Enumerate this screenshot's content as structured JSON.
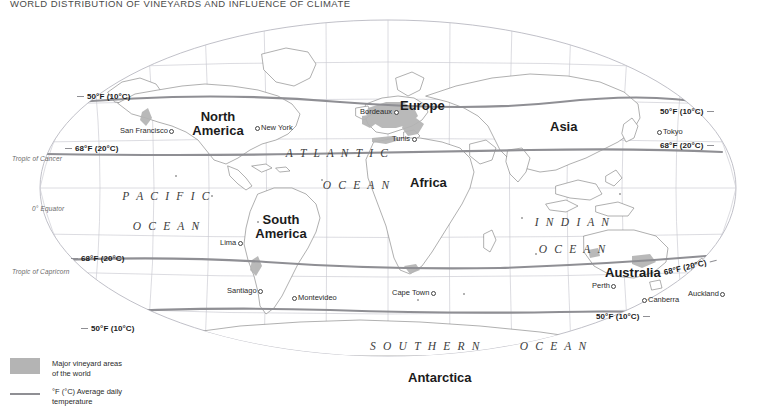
{
  "title": "WORLD DISTRIBUTION OF VINEYARDS AND INFLUENCE OF CLIMATE",
  "continents": [
    {
      "name": "north-america",
      "line1": "North",
      "line2": "America"
    },
    {
      "name": "south-america",
      "line1": "South",
      "line2": "America"
    },
    {
      "name": "europe",
      "line1": "Europe",
      "line2": ""
    },
    {
      "name": "africa",
      "line1": "Africa",
      "line2": ""
    },
    {
      "name": "asia",
      "line1": "Asia",
      "line2": ""
    },
    {
      "name": "australia",
      "line1": "Australia",
      "line2": ""
    },
    {
      "name": "antarctica",
      "line1": "Antarctica",
      "line2": ""
    }
  ],
  "oceans": [
    {
      "name": "pacific-ocean",
      "line1": "P A C I F I C",
      "line2": "O C E A N"
    },
    {
      "name": "atlantic-ocean",
      "line1": "A T L A N T I C",
      "line2": "O C E A N"
    },
    {
      "name": "indian-ocean",
      "line1": "I N D I A N",
      "line2": "O C E A N"
    },
    {
      "name": "southern-ocean",
      "line1": "S O U T H E R N",
      "line2": "O C E A N"
    }
  ],
  "cities": [
    {
      "name": "san-francisco",
      "label": "San Francisco"
    },
    {
      "name": "new-york",
      "label": "New York"
    },
    {
      "name": "bordeaux",
      "label": "Bordeaux"
    },
    {
      "name": "tunis",
      "label": "Tunis"
    },
    {
      "name": "tokyo",
      "label": "Tokyo"
    },
    {
      "name": "lima",
      "label": "Lima"
    },
    {
      "name": "santiago",
      "label": "Santiago"
    },
    {
      "name": "montevideo",
      "label": "Montevideo"
    },
    {
      "name": "cape-town",
      "label": "Cape Town"
    },
    {
      "name": "perth",
      "label": "Perth"
    },
    {
      "name": "canberra",
      "label": "Canberra"
    },
    {
      "name": "auckland",
      "label": "Auckland"
    }
  ],
  "isotherms": [
    {
      "name": "north-50f-left",
      "label": "50°F (10°C)"
    },
    {
      "name": "north-68f-left",
      "label": "68°F (20°C)"
    },
    {
      "name": "north-50f-right",
      "label": "50°F (10°C)"
    },
    {
      "name": "north-68f-right",
      "label": "68°F (20°C)"
    },
    {
      "name": "south-68f-left",
      "label": "68°F (20°C)"
    },
    {
      "name": "south-50f-left",
      "label": "50°F (10°C)"
    },
    {
      "name": "south-68f-right",
      "label": "68°F (20°C)"
    },
    {
      "name": "south-50f-right",
      "label": "50°F (10°C)"
    }
  ],
  "graticule_labels": [
    {
      "name": "tropic-of-cancer",
      "label": "Tropic of Cancer"
    },
    {
      "name": "equator",
      "label": "0° Equator"
    },
    {
      "name": "tropic-of-capricorn",
      "label": "Tropic of Capricorn"
    }
  ],
  "legend": {
    "vineyard_line1": "Major vineyard areas",
    "vineyard_line2": "of the world",
    "temperature_line1": "°F (°C) Average daily",
    "temperature_line2": "temperature"
  },
  "colors": {
    "vineyard_fill": "#b4b4b4",
    "isotherm_line": "#8f8f94",
    "coastline": "#6e6e6e",
    "graticule": "#c9c9d0",
    "land_fill": "#ffffff",
    "title_text": "#4a4a4a"
  }
}
